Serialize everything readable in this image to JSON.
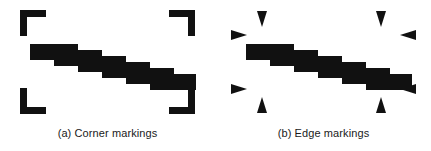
{
  "figure": {
    "background_color": "#ffffff",
    "ink_color": "#111111",
    "width": 431,
    "height": 151
  },
  "panels": [
    {
      "id": "a",
      "caption": "(a) Corner markings",
      "marking_type": "corner",
      "marking_count": 4,
      "marking_shape": "L-bracket",
      "markings": [
        {
          "name": "corner-marking-top-left",
          "position": "top-left",
          "x": 20,
          "y": 10,
          "size": 26,
          "stroke": 7
        },
        {
          "name": "corner-marking-top-right",
          "position": "top-right",
          "x": 169,
          "y": 10,
          "size": 26,
          "stroke": 7
        },
        {
          "name": "corner-marking-bottom-left",
          "position": "bottom-left",
          "x": 20,
          "y": 88,
          "size": 26,
          "stroke": 7
        },
        {
          "name": "corner-marking-bottom-right",
          "position": "bottom-right",
          "x": 169,
          "y": 88,
          "size": 26,
          "stroke": 7
        }
      ],
      "content": {
        "name": "staircase-shape",
        "description": "descending staircase bar",
        "steps": 6,
        "start_x": 30,
        "start_y": 44,
        "step_width": 24,
        "step_drop": 6,
        "bar_thickness": 16
      }
    },
    {
      "id": "b",
      "caption": "(b) Edge markings",
      "marking_type": "edge",
      "marking_count": 8,
      "marking_shape": "triangle-arrow",
      "markings": [
        {
          "name": "edge-marking-top-left",
          "direction": "down",
          "x": 46,
          "y": 12
        },
        {
          "name": "edge-marking-left-top",
          "direction": "right",
          "x": 22,
          "y": 34
        },
        {
          "name": "edge-marking-top-right",
          "direction": "down",
          "x": 165,
          "y": 12
        },
        {
          "name": "edge-marking-right-top",
          "direction": "left",
          "x": 189,
          "y": 34
        },
        {
          "name": "edge-marking-left-bottom",
          "direction": "right",
          "x": 22,
          "y": 92
        },
        {
          "name": "edge-marking-bottom-left",
          "direction": "up",
          "x": 46,
          "y": 110
        },
        {
          "name": "edge-marking-right-bottom",
          "direction": "left",
          "x": 189,
          "y": 92
        },
        {
          "name": "edge-marking-bottom-right",
          "direction": "up",
          "x": 165,
          "y": 110
        }
      ],
      "content": {
        "name": "staircase-shape",
        "description": "descending staircase bar",
        "steps": 6,
        "start_x": 30,
        "start_y": 44,
        "step_width": 24,
        "step_drop": 6,
        "bar_thickness": 16
      }
    }
  ]
}
